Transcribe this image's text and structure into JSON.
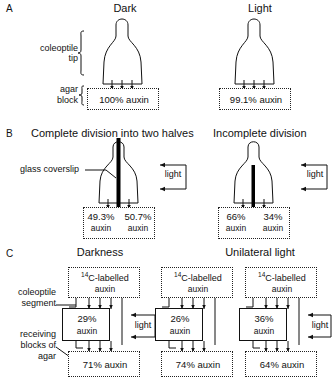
{
  "figure": {
    "title_hidden": "Auxin distribution in coleoptile tips under dark and light",
    "panels": [
      {
        "letter": "A",
        "columns": [
          {
            "heading": "Dark",
            "agar_value": "100%",
            "agar_unit": "auxin",
            "agar_label": "100% auxin"
          },
          {
            "heading": "Light",
            "agar_value": "99.1%",
            "agar_unit": "auxin",
            "agar_label": "99.1% auxin"
          }
        ],
        "side_labels": [
          {
            "line1": "coleoptile",
            "line2": "tip"
          },
          {
            "line1": "agar",
            "line2": "block"
          }
        ]
      },
      {
        "letter": "B",
        "columns": [
          {
            "heading": "Complete division into two halves",
            "left_value": "49.3%",
            "left_unit": "auxin",
            "right_value": "50.7%",
            "right_unit": "auxin",
            "light_label": "light"
          },
          {
            "heading": "Incomplete division",
            "left_value": "66%",
            "left_unit": "auxin",
            "right_value": "34%",
            "right_unit": "auxin",
            "light_label": "light"
          }
        ],
        "callout": "glass coverslip"
      },
      {
        "letter": "C",
        "headings": [
          "Darkness",
          "Unilateral light"
        ],
        "donor_line1_sup": "14",
        "donor_line1_rest": "C-labelled",
        "donor_line2": "auxin",
        "side_labels": [
          {
            "line1": "coleoptile",
            "line2": "segment"
          },
          {
            "line1": "receiving",
            "line2": "blocks of",
            "line3": "agar"
          }
        ],
        "groups": [
          {
            "name": "darkness",
            "segment_value": "29%",
            "segment_unit": "auxin",
            "receiver_label": "71% auxin",
            "light_label": "light",
            "has_light": true,
            "segment_side": "left"
          },
          {
            "name": "unilateral-light-1",
            "segment_value": "26%",
            "segment_unit": "auxin",
            "receiver_label": "74% auxin",
            "light_label": "",
            "has_light": false,
            "segment_side": "left"
          },
          {
            "name": "unilateral-light-2",
            "segment_value": "36%",
            "segment_unit": "auxin",
            "receiver_label": "64% auxin",
            "light_label": "light",
            "has_light": true,
            "segment_side": "left"
          }
        ]
      }
    ]
  },
  "colors": {
    "ink": "#111111",
    "coverslip": "#000000",
    "stipple": "#222222",
    "background": "#ffffff"
  }
}
